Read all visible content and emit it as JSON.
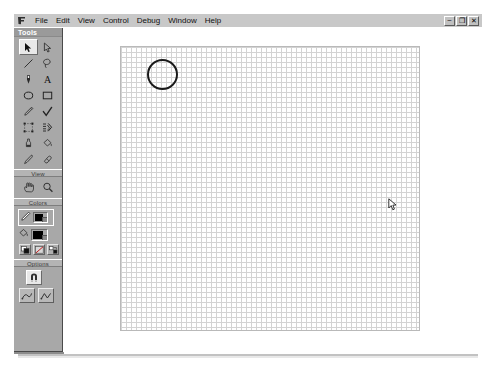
{
  "app": {
    "icon_name": "flash-app-icon",
    "menu_items": [
      {
        "label": "File",
        "name": "menu-file"
      },
      {
        "label": "Edit",
        "name": "menu-edit"
      },
      {
        "label": "View",
        "name": "menu-view"
      },
      {
        "label": "Control",
        "name": "menu-control"
      },
      {
        "label": "Debug",
        "name": "menu-debug"
      },
      {
        "label": "Window",
        "name": "menu-window"
      },
      {
        "label": "Help",
        "name": "menu-help"
      }
    ],
    "window_controls": [
      {
        "glyph": "–",
        "name": "minimize-button"
      },
      {
        "glyph": "❐",
        "name": "restore-button"
      },
      {
        "glyph": "✕",
        "name": "close-button"
      }
    ]
  },
  "tools_panel": {
    "title": "Tools",
    "sections": {
      "tools_label": "",
      "view_label": "View",
      "colors_label": "Colors",
      "options_label": "Options"
    },
    "tools": [
      {
        "name": "arrow-tool-icon",
        "label": "Arrow",
        "selected": true
      },
      {
        "name": "subselection-tool-icon",
        "label": "Subselection",
        "selected": false
      },
      {
        "name": "line-tool-icon",
        "label": "Line",
        "selected": false
      },
      {
        "name": "lasso-tool-icon",
        "label": "Lasso",
        "selected": false
      },
      {
        "name": "pen-tool-icon",
        "label": "Pen",
        "selected": false
      },
      {
        "name": "text-tool-icon",
        "label": "Text",
        "selected": false
      },
      {
        "name": "oval-tool-icon",
        "label": "Oval",
        "selected": false
      },
      {
        "name": "rectangle-tool-icon",
        "label": "Rectangle",
        "selected": false
      },
      {
        "name": "pencil-tool-icon",
        "label": "Pencil",
        "selected": false
      },
      {
        "name": "brush-tool-icon",
        "label": "Brush",
        "selected": false
      },
      {
        "name": "free-transform-tool-icon",
        "label": "Free Transform",
        "selected": false
      },
      {
        "name": "fill-transform-tool-icon",
        "label": "Fill Transform",
        "selected": false
      },
      {
        "name": "ink-bottle-tool-icon",
        "label": "Ink Bottle",
        "selected": false
      },
      {
        "name": "paint-bucket-tool-icon",
        "label": "Paint Bucket",
        "selected": false
      },
      {
        "name": "eyedropper-tool-icon",
        "label": "Eyedropper",
        "selected": false
      },
      {
        "name": "eraser-tool-icon",
        "label": "Eraser",
        "selected": false
      }
    ],
    "view_tools": [
      {
        "name": "hand-tool-icon",
        "label": "Hand"
      },
      {
        "name": "zoom-tool-icon",
        "label": "Zoom"
      }
    ],
    "colors": {
      "stroke_color": "#000000",
      "fill_color": "#000000",
      "stroke_icon_name": "pencil-stroke-icon",
      "fill_icon_name": "paint-bucket-fill-icon",
      "mini_buttons": [
        {
          "name": "black-and-white-button",
          "label": "Black and White"
        },
        {
          "name": "no-color-button",
          "label": "No Color"
        },
        {
          "name": "swap-colors-button",
          "label": "Swap Colors"
        }
      ]
    },
    "options": [
      {
        "name": "snap-to-objects-button",
        "label": "Snap to Objects",
        "pressed": true
      },
      {
        "name": "smooth-button",
        "label": "Smooth",
        "pressed": false
      },
      {
        "name": "straighten-button",
        "label": "Straighten",
        "pressed": false
      }
    ]
  },
  "stage": {
    "document_name": "canvas-document",
    "grid_minor_spacing_px": 5,
    "grid_major_spacing_px": 25,
    "grid_minor_color": "#d3d3d3",
    "grid_major_color": "#bdbdbd",
    "background_color": "#ffffff",
    "shapes": [
      {
        "name": "circle-shape",
        "type": "ellipse",
        "stroke_color": "#1a1a1a",
        "fill_color": "none",
        "stroke_width_px": 2
      }
    ],
    "cursor_name": "mouse-pointer-cursor"
  }
}
